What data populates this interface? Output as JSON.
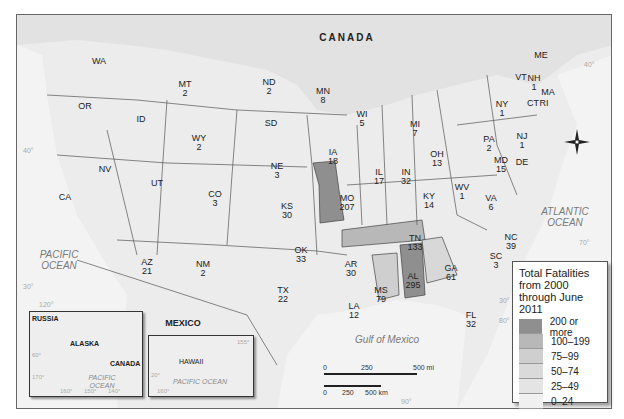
{
  "title": "Total Fatalities from 2000 through June 2011",
  "legend": {
    "title": "Total Fatalities from 2000 through June 2011",
    "classes": [
      {
        "label": "200 or more",
        "color": "#8f8f8f"
      },
      {
        "label": "100–199",
        "color": "#b8b8b8"
      },
      {
        "label": "75–99",
        "color": "#cfcfcf"
      },
      {
        "label": "50–74",
        "color": "#dadada"
      },
      {
        "label": "25–49",
        "color": "#e4e4e4"
      },
      {
        "label": "0–24",
        "color": "#f0f0f0"
      }
    ]
  },
  "countries": {
    "canada": "CANADA",
    "mexico": "MEXICO"
  },
  "oceans": {
    "pacific": "PACIFIC OCEAN",
    "atlantic": "ATLANTIC OCEAN",
    "gulf": "Gulf of Mexico"
  },
  "states": [
    {
      "abbr": "WA",
      "value": ""
    },
    {
      "abbr": "OR",
      "value": ""
    },
    {
      "abbr": "ID",
      "value": ""
    },
    {
      "abbr": "MT",
      "value": "2"
    },
    {
      "abbr": "WY",
      "value": "2"
    },
    {
      "abbr": "CA",
      "value": ""
    },
    {
      "abbr": "NV",
      "value": ""
    },
    {
      "abbr": "UT",
      "value": ""
    },
    {
      "abbr": "CO",
      "value": "3"
    },
    {
      "abbr": "AZ",
      "value": "21"
    },
    {
      "abbr": "NM",
      "value": "2"
    },
    {
      "abbr": "ND",
      "value": "2"
    },
    {
      "abbr": "SD",
      "value": ""
    },
    {
      "abbr": "NE",
      "value": "3"
    },
    {
      "abbr": "KS",
      "value": "30"
    },
    {
      "abbr": "OK",
      "value": "33"
    },
    {
      "abbr": "TX",
      "value": "22"
    },
    {
      "abbr": "MN",
      "value": "8"
    },
    {
      "abbr": "IA",
      "value": "18"
    },
    {
      "abbr": "MO",
      "value": "207"
    },
    {
      "abbr": "AR",
      "value": "30"
    },
    {
      "abbr": "LA",
      "value": "12"
    },
    {
      "abbr": "WI",
      "value": "5"
    },
    {
      "abbr": "IL",
      "value": "17"
    },
    {
      "abbr": "MS",
      "value": "79"
    },
    {
      "abbr": "MI",
      "value": "7"
    },
    {
      "abbr": "IN",
      "value": "32"
    },
    {
      "abbr": "KY",
      "value": "14"
    },
    {
      "abbr": "TN",
      "value": "133"
    },
    {
      "abbr": "AL",
      "value": "295"
    },
    {
      "abbr": "OH",
      "value": "13"
    },
    {
      "abbr": "GA",
      "value": "61"
    },
    {
      "abbr": "FL",
      "value": "32"
    },
    {
      "abbr": "WV",
      "value": "1"
    },
    {
      "abbr": "VA",
      "value": "6"
    },
    {
      "abbr": "NC",
      "value": "39"
    },
    {
      "abbr": "SC",
      "value": "3"
    },
    {
      "abbr": "PA",
      "value": "2"
    },
    {
      "abbr": "NY",
      "value": "1"
    },
    {
      "abbr": "MD",
      "value": "15"
    },
    {
      "abbr": "DE",
      "value": ""
    },
    {
      "abbr": "NJ",
      "value": "1"
    },
    {
      "abbr": "CT",
      "value": ""
    },
    {
      "abbr": "RI",
      "value": ""
    },
    {
      "abbr": "MA",
      "value": ""
    },
    {
      "abbr": "VT",
      "value": ""
    },
    {
      "abbr": "NH",
      "value": "1"
    },
    {
      "abbr": "ME",
      "value": ""
    }
  ],
  "insets": {
    "alaska": {
      "labels": [
        "RUSSIA",
        "ALASKA",
        "CANADA"
      ],
      "ocean": "PACIFIC OCEAN",
      "coords": [
        "120°",
        "60°",
        "170°",
        "160°",
        "150°",
        "140°"
      ]
    },
    "hawaii": {
      "label": "HAWAII",
      "ocean": "PACIFIC OCEAN",
      "coords": [
        "155°",
        "20°",
        "160°"
      ]
    }
  },
  "scale_bar": {
    "miles": [
      "0",
      "250",
      "500 mi"
    ],
    "km": [
      "0",
      "250",
      "500 km"
    ]
  },
  "graticule": [
    "40°",
    "40°",
    "30°",
    "70°",
    "30°",
    "80°",
    "90°"
  ],
  "compass": {
    "n": "N",
    "e": "E",
    "s": "S",
    "w": "W"
  }
}
